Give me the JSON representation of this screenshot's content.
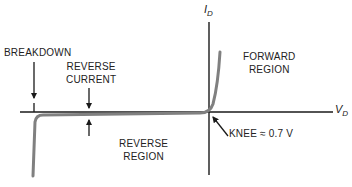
{
  "diagram": {
    "axes": {
      "y_label": "I",
      "y_label_sub": "D",
      "x_label": "V",
      "x_label_sub": "D"
    },
    "labels": {
      "breakdown": "BREAKDOWN",
      "reverse_current_line1": "REVERSE",
      "reverse_current_line2": "CURRENT",
      "forward_region_line1": "FORWARD",
      "forward_region_line2": "REGION",
      "reverse_region_line1": "REVERSE",
      "reverse_region_line2": "REGION",
      "knee": "KNEE ≈ 0.7 V"
    },
    "colors": {
      "axis": "#1a1a1a",
      "curve": "#808080",
      "text": "#222222"
    }
  }
}
